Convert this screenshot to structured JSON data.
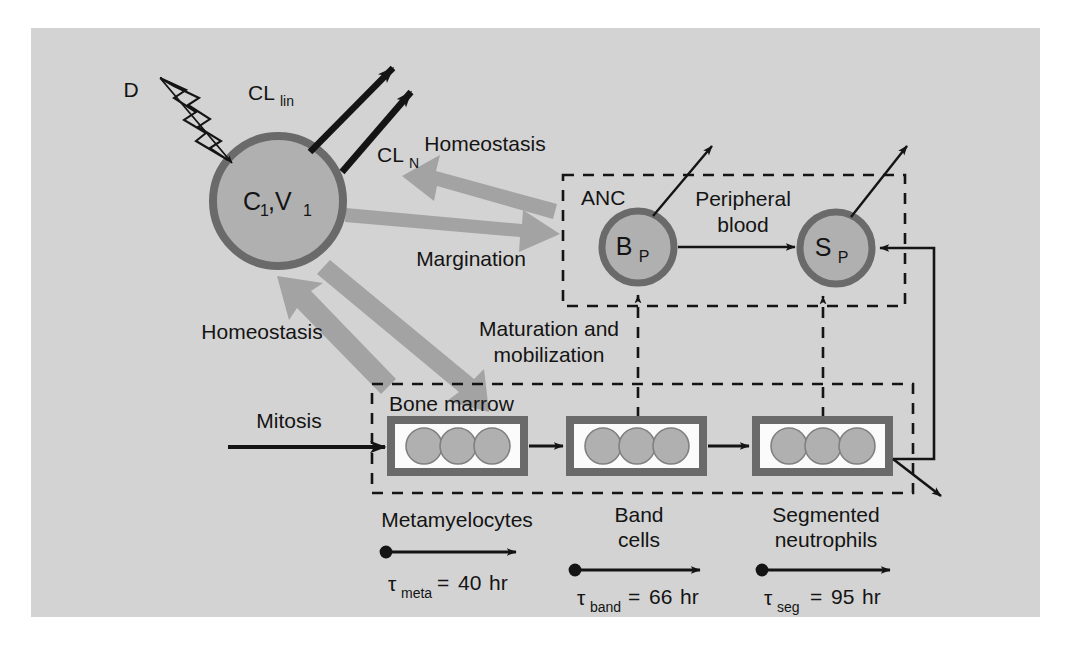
{
  "figure": {
    "background_color": "#ffffff",
    "canvas_color": "#d3d3d3",
    "node_fill_color": "#b0b0b0",
    "node_stroke_color": "#6a6a6a",
    "gray_arrow_color": "#a3a3a3",
    "black_ink_color": "#141414",
    "cell_box_border_color": "#6a6a6a",
    "cell_box_fill_color": "#fbfbfb"
  },
  "central_compartment": {
    "dose_label": "D",
    "node_label_main": "C",
    "node_label_main_sub": "1",
    "node_label_second": ",V",
    "node_label_second_sub": "1",
    "clearance_linear": {
      "base": "CL",
      "sub": "lin"
    },
    "clearance_neutrophil": {
      "base": "CL",
      "sub": "N"
    }
  },
  "gray_flows": [
    {
      "name": "homeostasis-blood",
      "label": "Homeostasis",
      "direction": "blood-to-central"
    },
    {
      "name": "margination",
      "label": "Margination",
      "direction": "central-to-blood"
    },
    {
      "name": "homeostasis-marrow",
      "label": "Homeostasis",
      "direction": "marrow-to-central"
    },
    {
      "name": "maturation-mobilization",
      "label_line1": "Maturation and",
      "label_line2": "mobilization",
      "direction": "central-to-marrow"
    }
  ],
  "peripheral_blood": {
    "compartment_tag": "ANC",
    "title_line1": "Peripheral",
    "title_line2": "blood",
    "nodes": [
      {
        "name": "banded-pool",
        "base": "B",
        "sub": "P"
      },
      {
        "name": "segmented-pool",
        "base": "S",
        "sub": "P"
      }
    ]
  },
  "bone_marrow": {
    "compartment_tag": "Bone marrow",
    "input_label": "Mitosis",
    "pools": [
      {
        "name": "metamyelocytes",
        "label": "Metamyelocytes",
        "label_line2": "",
        "cell_count": 3,
        "transit": {
          "symbol": "τ",
          "sub": "meta",
          "equals": "=",
          "value": "40",
          "unit": "hr",
          "full": "τmeta = 40 hr"
        }
      },
      {
        "name": "band-cells",
        "label": "Band",
        "label_line2": "cells",
        "cell_count": 3,
        "transit": {
          "symbol": "τ",
          "sub": "band",
          "equals": "=",
          "value": "66",
          "unit": "hr",
          "full": "τband = 66 hr"
        }
      },
      {
        "name": "segmented-neutrophils",
        "label": "Segmented",
        "label_line2": "neutrophils",
        "cell_count": 3,
        "transit": {
          "symbol": "τ",
          "sub": "seg",
          "equals": "=",
          "value": "95",
          "unit": "hr",
          "full": "τseg = 95 hr"
        }
      }
    ]
  }
}
